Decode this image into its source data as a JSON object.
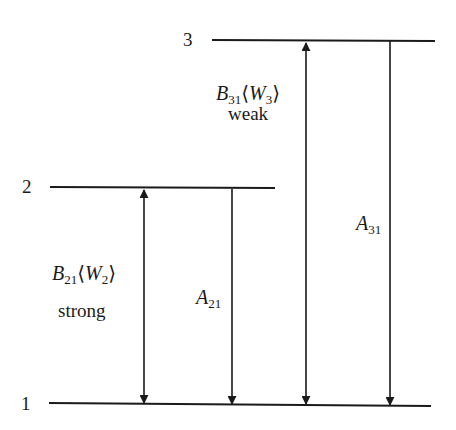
{
  "diagram": {
    "type": "energy-level-diagram",
    "levels": [
      {
        "id": "1",
        "label": "1"
      },
      {
        "id": "2",
        "label": "2"
      },
      {
        "id": "3",
        "label": "3"
      }
    ],
    "transitions": [
      {
        "id": "b21",
        "from": "1",
        "to": "2",
        "kind": "absorption-stimulated",
        "arrow": "double",
        "symbol": "B",
        "subscript": "21",
        "field_symbol": "W",
        "field_subscript": "2",
        "strength": "strong"
      },
      {
        "id": "a21",
        "from": "2",
        "to": "1",
        "kind": "spontaneous-emission",
        "arrow": "down",
        "symbol": "A",
        "subscript": "21"
      },
      {
        "id": "b31",
        "from": "1",
        "to": "3",
        "kind": "absorption-stimulated",
        "arrow": "double",
        "symbol": "B",
        "subscript": "31",
        "field_symbol": "W",
        "field_subscript": "3",
        "strength": "weak"
      },
      {
        "id": "a31",
        "from": "3",
        "to": "1",
        "kind": "spontaneous-emission",
        "arrow": "down",
        "symbol": "A",
        "subscript": "31"
      }
    ],
    "angle_open": "⟨",
    "angle_close": "⟩",
    "line_color": "#1a1a1a",
    "background": "#ffffff"
  }
}
